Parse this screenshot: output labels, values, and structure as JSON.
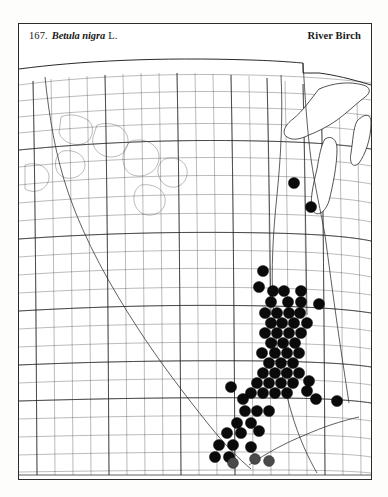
{
  "plate": {
    "number": "167.",
    "scientific_name": "Betula nigra",
    "authority": "L.",
    "common_name": "River Birch"
  },
  "map": {
    "type": "county-dot-distribution-map",
    "region": "Central and Upper Midwest United States",
    "symbol_legend": {
      "solid_dot": "county record",
      "grey_dot": "county record"
    }
  },
  "chart_data": {
    "type": "scatter",
    "xlabel": "",
    "ylabel": "",
    "xlim": [
      0,
      352
    ],
    "ylim": [
      0,
      424
    ],
    "grid": false,
    "legend": "none",
    "note": "Filled circles mark counties with documented occurrence records.",
    "series": [
      {
        "name": "county records (solid)",
        "marker": "filled-circle",
        "color": "#0a0a0a",
        "points": [
          [
            275,
            128
          ],
          [
            292,
            152
          ],
          [
            244,
            216
          ],
          [
            240,
            232
          ],
          [
            254,
            236
          ],
          [
            265,
            236
          ],
          [
            282,
            236
          ],
          [
            252,
            247
          ],
          [
            269,
            247
          ],
          [
            282,
            247
          ],
          [
            300,
            249
          ],
          [
            246,
            258
          ],
          [
            258,
            258
          ],
          [
            270,
            258
          ],
          [
            281,
            258
          ],
          [
            252,
            268
          ],
          [
            263,
            268
          ],
          [
            275,
            268
          ],
          [
            288,
            268
          ],
          [
            246,
            278
          ],
          [
            258,
            278
          ],
          [
            270,
            278
          ],
          [
            282,
            278
          ],
          [
            252,
            288
          ],
          [
            264,
            288
          ],
          [
            276,
            288
          ],
          [
            243,
            298
          ],
          [
            256,
            298
          ],
          [
            268,
            298
          ],
          [
            280,
            298
          ],
          [
            250,
            308
          ],
          [
            262,
            308
          ],
          [
            274,
            308
          ],
          [
            244,
            318
          ],
          [
            256,
            318
          ],
          [
            268,
            318
          ],
          [
            280,
            318
          ],
          [
            238,
            328
          ],
          [
            250,
            328
          ],
          [
            262,
            328
          ],
          [
            274,
            328
          ],
          [
            290,
            326
          ],
          [
            232,
            338
          ],
          [
            244,
            338
          ],
          [
            256,
            338
          ],
          [
            268,
            338
          ],
          [
            288,
            336
          ],
          [
            212,
            332
          ],
          [
            224,
            344
          ],
          [
            297,
            344
          ],
          [
            318,
            346
          ],
          [
            226,
            356
          ],
          [
            238,
            356
          ],
          [
            250,
            356
          ],
          [
            218,
            368
          ],
          [
            232,
            368
          ],
          [
            208,
            378
          ],
          [
            222,
            378
          ],
          [
            240,
            376
          ],
          [
            200,
            390
          ],
          [
            214,
            390
          ],
          [
            232,
            392
          ],
          [
            196,
            402
          ],
          [
            210,
            402
          ]
        ]
      },
      {
        "name": "county records (grey)",
        "marker": "filled-circle-grey",
        "color": "#4a4a4a",
        "points": [
          [
            214,
            408
          ],
          [
            236,
            404
          ],
          [
            250,
            406
          ]
        ]
      }
    ]
  }
}
